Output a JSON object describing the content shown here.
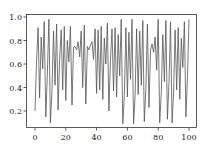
{
  "chart_data": {
    "type": "line",
    "title": "",
    "xlabel": "",
    "ylabel": "",
    "xlim": [
      -5,
      105
    ],
    "ylim": [
      0.05,
      1.02
    ],
    "grid": false,
    "legend": null,
    "x_ticks": [
      "0",
      "20",
      "40",
      "60",
      "80",
      "100"
    ],
    "y_ticks": [
      "0.2",
      "0.4",
      "0.6",
      "0.8",
      "1.0"
    ],
    "line_color": "#555555",
    "series": [
      {
        "name": "series",
        "x": [
          0,
          1,
          2,
          3,
          4,
          5,
          6,
          7,
          8,
          9,
          10,
          11,
          12,
          13,
          14,
          15,
          16,
          17,
          18,
          19,
          20,
          21,
          22,
          23,
          24,
          25,
          26,
          27,
          28,
          29,
          30,
          31,
          32,
          33,
          34,
          35,
          36,
          37,
          38,
          39,
          40,
          41,
          42,
          43,
          44,
          45,
          46,
          47,
          48,
          49,
          50,
          51,
          52,
          53,
          54,
          55,
          56,
          57,
          58,
          59,
          60,
          61,
          62,
          63,
          64,
          65,
          66,
          67,
          68,
          69,
          70,
          71,
          72,
          73,
          74,
          75,
          76,
          77,
          78,
          79,
          80,
          81,
          82,
          83,
          84,
          85,
          86,
          87,
          88,
          89,
          90,
          91,
          92,
          93,
          94,
          95,
          96,
          97,
          98,
          99,
          100
        ],
        "values": [
          0.2,
          0.62,
          0.91,
          0.31,
          0.83,
          0.56,
          0.96,
          0.15,
          0.5,
          0.98,
          0.1,
          0.35,
          0.88,
          0.42,
          0.94,
          0.21,
          0.64,
          0.89,
          0.38,
          0.92,
          0.29,
          0.8,
          0.62,
          0.92,
          0.25,
          0.74,
          0.75,
          0.72,
          0.79,
          0.66,
          0.88,
          0.4,
          0.93,
          0.26,
          0.75,
          0.72,
          0.76,
          0.79,
          0.64,
          0.9,
          0.35,
          0.89,
          0.38,
          0.92,
          0.3,
          0.82,
          0.6,
          0.95,
          0.2,
          0.64,
          0.9,
          0.37,
          0.91,
          0.32,
          0.85,
          0.5,
          0.98,
          0.09,
          0.33,
          0.91,
          0.32,
          0.87,
          0.47,
          0.98,
          0.09,
          0.33,
          0.9,
          0.34,
          0.88,
          0.42,
          0.97,
          0.11,
          0.39,
          0.94,
          0.23,
          0.72,
          0.77,
          0.7,
          0.83,
          0.55,
          0.98,
          0.1,
          0.36,
          0.85,
          0.45,
          0.97,
          0.13,
          0.44,
          0.96,
          0.1,
          0.36,
          0.89,
          0.38,
          0.91,
          0.3,
          0.82,
          0.57,
          0.96,
          0.15,
          0.5,
          0.98
        ]
      }
    ]
  }
}
